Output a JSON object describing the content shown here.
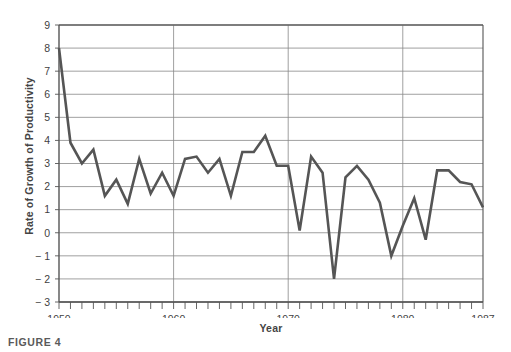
{
  "figure": {
    "caption": "FIGURE 4"
  },
  "chart_data": {
    "type": "line",
    "title": "",
    "xlabel": "Year",
    "ylabel": "Rate of Growth of Productivity",
    "xlim": [
      1950,
      1987
    ],
    "ylim": [
      -3,
      9
    ],
    "grid": true,
    "legend": "none",
    "line_color": "#555555",
    "axis_color": "#555555",
    "grid_color": "#888888",
    "background": "#ffffff",
    "y_ticks": [
      9,
      8,
      7,
      6,
      5,
      4,
      3,
      2,
      1,
      0,
      -1,
      -2,
      -3
    ],
    "y_tick_labels": [
      "9",
      "8",
      "7",
      "6",
      "5",
      "4",
      "3",
      "2",
      "1",
      "0",
      "− 1",
      "− 2",
      "− 3"
    ],
    "x_ticks": [
      1950,
      1951,
      1952,
      1953,
      1954,
      1955,
      1956,
      1957,
      1958,
      1959,
      1960,
      1961,
      1962,
      1963,
      1964,
      1965,
      1966,
      1967,
      1968,
      1969,
      1970,
      1971,
      1972,
      1973,
      1974,
      1975,
      1976,
      1977,
      1978,
      1979,
      1980,
      1981,
      1982,
      1983,
      1984,
      1985,
      1986,
      1987
    ],
    "x_tick_labels": [
      {
        "value": 1950,
        "label": "1950"
      },
      {
        "value": 1960,
        "label": "1960"
      },
      {
        "value": 1970,
        "label": "1970"
      },
      {
        "value": 1980,
        "label": "1980"
      },
      {
        "value": 1987,
        "label": "1987"
      }
    ],
    "x_gridlines": [
      1960,
      1970,
      1980
    ],
    "x": [
      1950,
      1951,
      1952,
      1953,
      1954,
      1955,
      1956,
      1957,
      1958,
      1959,
      1960,
      1961,
      1962,
      1963,
      1964,
      1965,
      1966,
      1967,
      1968,
      1969,
      1970,
      1971,
      1972,
      1973,
      1974,
      1975,
      1976,
      1977,
      1978,
      1979,
      1980,
      1981,
      1982,
      1983,
      1984,
      1985,
      1986,
      1987
    ],
    "values": [
      8.0,
      3.9,
      3.0,
      3.6,
      1.6,
      2.3,
      1.25,
      3.2,
      1.7,
      2.6,
      1.6,
      3.2,
      3.3,
      2.6,
      3.2,
      1.6,
      3.5,
      3.5,
      4.2,
      2.9,
      2.9,
      0.1,
      3.3,
      2.6,
      -2.0,
      2.4,
      2.9,
      2.3,
      1.3,
      -1.0,
      0.3,
      1.5,
      -0.3,
      2.7,
      2.7,
      2.2,
      2.1,
      1.1
    ]
  }
}
